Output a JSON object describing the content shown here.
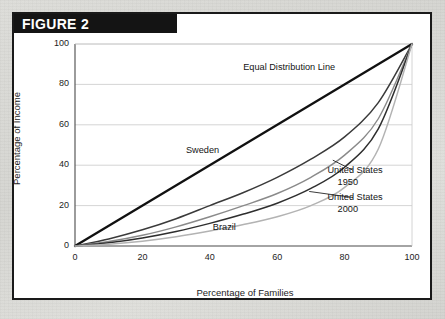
{
  "figure": {
    "banner_label": "FIGURE 2"
  },
  "chart_data": {
    "type": "line",
    "title": "FIGURE 2",
    "xlabel": "Percentage of Families",
    "ylabel": "Percentage of Income",
    "xlim": [
      0,
      100
    ],
    "ylim": [
      0,
      100
    ],
    "xticks": [
      0,
      20,
      40,
      60,
      80,
      100
    ],
    "yticks": [
      0,
      20,
      40,
      60,
      80,
      100
    ],
    "grid": "horizontal",
    "legend_position": "inline-annotations",
    "x": [
      0,
      10,
      20,
      30,
      40,
      50,
      60,
      70,
      80,
      90,
      100
    ],
    "series": [
      {
        "name": "Equal Distribution Line",
        "color": "#111111",
        "width": 2.3,
        "values": [
          0,
          10,
          20,
          30,
          40,
          50,
          60,
          70,
          80,
          90,
          100
        ]
      },
      {
        "name": "Sweden",
        "color": "#3a3a3a",
        "width": 1.5,
        "values": [
          0,
          3.5,
          8,
          13.5,
          20,
          26.5,
          34,
          43,
          54,
          71,
          100
        ]
      },
      {
        "name": "United States 1950",
        "color": "#8a8a8a",
        "width": 1.4,
        "values": [
          0,
          2.2,
          5.3,
          9.5,
          14.5,
          20,
          26,
          34,
          45,
          63,
          100
        ]
      },
      {
        "name": "United States 2000",
        "color": "#2e2e2e",
        "width": 1.5,
        "values": [
          0,
          1.6,
          4,
          7.2,
          11.2,
          15.8,
          21.2,
          28.5,
          39,
          58,
          100
        ]
      },
      {
        "name": "Brazil",
        "color": "#b3b3b3",
        "width": 1.5,
        "values": [
          0,
          0.9,
          2.4,
          4.6,
          7.4,
          10.6,
          14.5,
          20,
          29,
          48,
          100
        ]
      }
    ],
    "annotations": [
      {
        "text": "Equal Distribution Line",
        "x": 60,
        "y": 88
      },
      {
        "text": "Sweden",
        "x": 43,
        "y": 47
      },
      {
        "text": "United States",
        "x": 85,
        "y": 37
      },
      {
        "text": "1950",
        "x": 88,
        "y": 31
      },
      {
        "text": "United States",
        "x": 85,
        "y": 24
      },
      {
        "text": "2000",
        "x": 88,
        "y": 18
      },
      {
        "text": "Brazil",
        "x": 51,
        "y": 9
      }
    ]
  },
  "ticks": {
    "x": [
      "0",
      "20",
      "40",
      "60",
      "80",
      "100"
    ],
    "y": [
      "0",
      "20",
      "40",
      "60",
      "80",
      "100"
    ]
  },
  "labels": {
    "equal_distribution": "Equal Distribution Line",
    "sweden": "Sweden",
    "us1950_line1": "United States",
    "us1950_line2": "1950",
    "us2000_line1": "United States",
    "us2000_line2": "2000",
    "brazil": "Brazil"
  }
}
